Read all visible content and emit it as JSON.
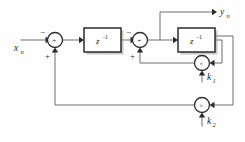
{
  "figure": {
    "kind": "signal-flow-block-diagram",
    "background_color": "#fefefe",
    "wire_color": "#6e6e6e",
    "line_color": "#2b2b2b",
    "width": 245,
    "height": 142
  },
  "labels": {
    "input": "x",
    "input_sub": "n",
    "output": "y",
    "output_sub": "n",
    "coef1": "k",
    "coef1_sub": "1",
    "coef2": "k",
    "coef2_sub": "2"
  },
  "blocks": [
    {
      "id": "delay-1",
      "name": "first-unit-delay",
      "label": "z",
      "exponent": "-1",
      "x": 84,
      "y": 28,
      "width": 37,
      "height": 24
    },
    {
      "id": "delay-2",
      "name": "second-unit-delay",
      "label": "z",
      "exponent": "-1",
      "x": 178,
      "y": 28,
      "width": 37,
      "height": 24
    }
  ],
  "adders": [
    {
      "id": "adder-1",
      "name": "first-summing-junction",
      "glyph": "+",
      "cx": 55,
      "cy": 40,
      "r": 7.5,
      "input_signs": [
        {
          "sign": "−",
          "x": 42,
          "y": 32,
          "port": "left"
        },
        {
          "sign": "+",
          "x": 47,
          "y": 56,
          "port": "bottom"
        }
      ]
    },
    {
      "id": "adder-2",
      "name": "second-summing-junction",
      "glyph": "+",
      "cx": 140,
      "cy": 40,
      "r": 7.5,
      "input_signs": [
        {
          "sign": "−",
          "x": 128,
          "y": 32,
          "port": "left"
        },
        {
          "sign": "+",
          "x": 132,
          "y": 56,
          "port": "bottom"
        }
      ]
    }
  ],
  "multipliers": [
    {
      "id": "mult-k1",
      "name": "coefficient-multiplier-k1",
      "glyph": "×",
      "cx": 202,
      "cy": 63,
      "r": 7.5,
      "coefficient": "k1"
    },
    {
      "id": "mult-k2",
      "name": "coefficient-multiplier-k2",
      "glyph": "×",
      "cx": 202,
      "cy": 105,
      "r": 7.5,
      "coefficient": "k2"
    }
  ],
  "signal_paths": [
    {
      "name": "input-to-adder1",
      "from": "x_n",
      "to": "adder-1",
      "sign": "minus"
    },
    {
      "name": "adder1-to-delay1",
      "from": "adder-1",
      "to": "delay-1"
    },
    {
      "name": "delay1-to-adder2",
      "from": "delay-1",
      "to": "adder-2",
      "sign": "minus"
    },
    {
      "name": "adder2-to-delay2",
      "from": "adder-2",
      "to": "delay-2"
    },
    {
      "name": "adder2-to-output",
      "from": "adder-2",
      "to": "y_n"
    },
    {
      "name": "delay2-to-mult-k1",
      "from": "delay-2",
      "to": "mult-k1"
    },
    {
      "name": "delay2-to-mult-k2",
      "from": "delay-2",
      "to": "mult-k2"
    },
    {
      "name": "mult-k1-to-adder2",
      "from": "mult-k1",
      "to": "adder-2",
      "sign": "plus"
    },
    {
      "name": "mult-k2-to-adder1",
      "from": "mult-k2",
      "to": "adder-1",
      "sign": "plus"
    }
  ]
}
